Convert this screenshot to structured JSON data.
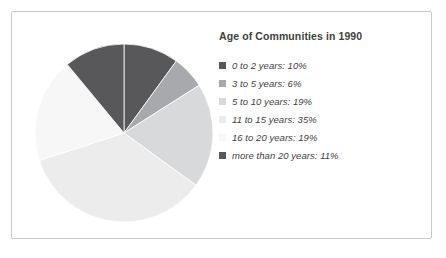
{
  "chart_data": {
    "type": "pie",
    "title": "Age of Communities in 1990",
    "xlabel": "",
    "ylabel": "",
    "legend_position": "right",
    "grid": false,
    "start_angle_deg": 0,
    "direction": "clockwise",
    "categories": [
      "0 to 2 years",
      "3 to 5 years",
      "5 to 10 years",
      "11 to 15 years",
      "16 to 20 years",
      "more than 20 years"
    ],
    "values": [
      10,
      6,
      19,
      35,
      19,
      11
    ],
    "value_unit": "%",
    "colors": [
      "#58585a",
      "#a7a9ac",
      "#d8d9da",
      "#ececec",
      "#f7f7f7",
      "#58585a"
    ],
    "slices": [
      {
        "label": "0 to 2 years",
        "value": 10,
        "display": "0 to 2 years: 10%",
        "color": "#58585a"
      },
      {
        "label": "3 to 5 years",
        "value": 6,
        "display": "3 to 5 years: 6%",
        "color": "#a7a9ac"
      },
      {
        "label": "5 to 10 years",
        "value": 19,
        "display": "5 to 10 years: 19%",
        "color": "#d8d9da"
      },
      {
        "label": "11 to 15 years",
        "value": 35,
        "display": "11 to 15 years: 35%",
        "color": "#ececec"
      },
      {
        "label": "16 to 20 years",
        "value": 19,
        "display": "16 to 20 years: 19%",
        "color": "#f7f7f7"
      },
      {
        "label": "more than 20 years",
        "value": 11,
        "display": "more than 20 years: 11%",
        "color": "#58585a"
      }
    ]
  },
  "title": "Age of Communities in 1990",
  "legend": {
    "items": [
      {
        "text": "0 to 2 years: 10%",
        "color": "#58585a"
      },
      {
        "text": "3 to 5 years: 6%",
        "color": "#a7a9ac"
      },
      {
        "text": "5 to 10 years: 19%",
        "color": "#d8d9da"
      },
      {
        "text": "11 to 15 years: 35%",
        "color": "#ececec"
      },
      {
        "text": "16 to 20 years: 19%",
        "color": "#f7f7f7"
      },
      {
        "text": "more than 20 years: 11%",
        "color": "#58585a"
      }
    ]
  },
  "style": {
    "frame_border": "#c9c9c9",
    "background": "#ffffff",
    "text_color": "#3f3f41"
  }
}
